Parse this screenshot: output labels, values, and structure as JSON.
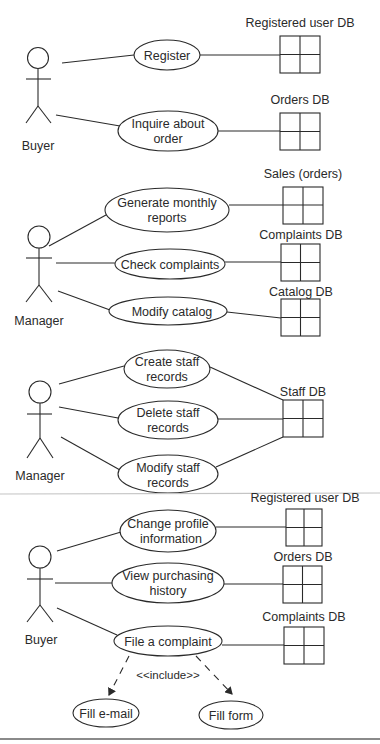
{
  "diagram": {
    "type": "uml-use-case",
    "sections": [
      {
        "actor": {
          "label": "Buyer"
        },
        "use_cases": [
          {
            "lines": [
              "Register"
            ],
            "database": "Registered user DB"
          },
          {
            "lines": [
              "Inquire about",
              "order"
            ],
            "database": "Orders DB"
          }
        ]
      },
      {
        "actor": {
          "label": "Manager"
        },
        "use_cases": [
          {
            "lines": [
              "Generate monthly",
              "reports"
            ],
            "database": "Sales (orders)"
          },
          {
            "lines": [
              "Check complaints"
            ],
            "database": "Complaints DB"
          },
          {
            "lines": [
              "Modify catalog"
            ],
            "database": "Catalog DB"
          }
        ]
      },
      {
        "actor": {
          "label": "Manager"
        },
        "use_cases": [
          {
            "lines": [
              "Create staff",
              "records"
            ]
          },
          {
            "lines": [
              "Delete staff",
              "records"
            ]
          },
          {
            "lines": [
              "Modify staff",
              "records"
            ]
          }
        ],
        "database": "Staff DB"
      },
      {
        "actor": {
          "label": "Buyer"
        },
        "use_cases": [
          {
            "lines": [
              "Change profile",
              "information"
            ],
            "database": "Registered user DB"
          },
          {
            "lines": [
              "View purchasing",
              "history"
            ],
            "database": "Orders DB"
          },
          {
            "lines": [
              "File a complaint"
            ],
            "database": "Complaints DB"
          }
        ],
        "include": {
          "label": "<<include>>",
          "targets": [
            {
              "lines": [
                "Fill e-mail"
              ]
            },
            {
              "lines": [
                "Fill form"
              ]
            }
          ]
        }
      }
    ]
  }
}
